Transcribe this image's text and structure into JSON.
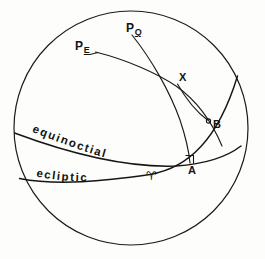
{
  "figure": {
    "type": "celestial-sphere-diagram",
    "background_color": "#fdfdfb",
    "ink_color": "#161616"
  },
  "sphere": {
    "name": "celestial-sphere-outline",
    "center_x": 131,
    "center_y": 128,
    "radius": 117
  },
  "labels": {
    "pole_ecliptic": {
      "main": "P",
      "sub": "E"
    },
    "pole_equinoctial": {
      "main": "P",
      "sub": "Q"
    },
    "point_x": "X",
    "point_b": "B",
    "point_a": "A",
    "first_point_aries": "♈"
  },
  "great_circles": {
    "equinoctial": "equinoctial",
    "ecliptic": "ecliptic"
  },
  "markers": {
    "right_angle_at_a": "right-angle-marker"
  }
}
